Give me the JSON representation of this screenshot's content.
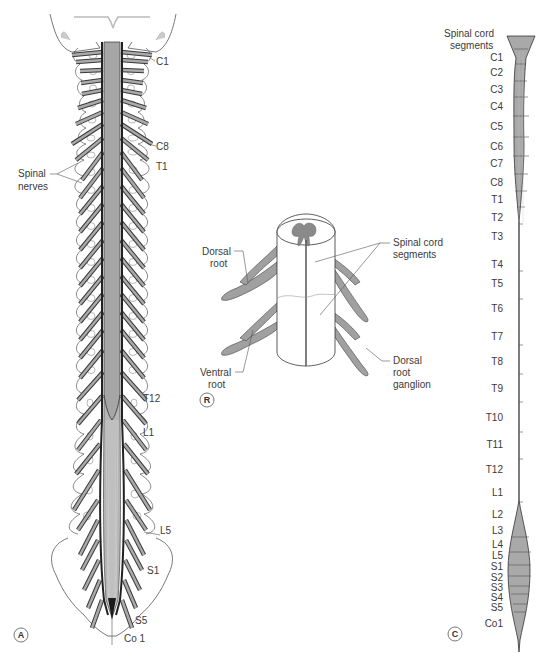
{
  "figure": {
    "panels": [
      {
        "id": "A",
        "description": "Posterior view of vertebral column with spinal cord and spinal nerves",
        "labels": {
          "c1": "C1",
          "c8": "C8",
          "t1": "T1",
          "t12": "T12",
          "l1": "L1",
          "l5": "L5",
          "s1": "S1",
          "s5": "S5",
          "co1": "Co 1",
          "spinal_nerves_line1": "Spinal",
          "spinal_nerves_line2": "nerves"
        }
      },
      {
        "id": "B",
        "letter_shown": "R",
        "description": "Cross-section of spinal cord segments with roots",
        "labels": {
          "dorsal_root_line1": "Dorsal",
          "dorsal_root_line2": "root",
          "ventral_root_line1": "Ventral",
          "ventral_root_line2": "root",
          "spinal_cord_segments_line1": "Spinal cord",
          "spinal_cord_segments_line2": "segments",
          "drg_line1": "Dorsal",
          "drg_line2": "root",
          "drg_line3": "ganglion"
        }
      },
      {
        "id": "C",
        "description": "Spinal cord segments column",
        "title_line1": "Spinal cord",
        "title_line2": "segments",
        "segments": [
          "C1",
          "C2",
          "C3",
          "C4",
          "C5",
          "C6",
          "C7",
          "C8",
          "T1",
          "T2",
          "T3",
          "T4",
          "T5",
          "T6",
          "T7",
          "T8",
          "T9",
          "T10",
          "T11",
          "T12",
          "L1",
          "L2",
          "L3",
          "L4",
          "L5",
          "S1",
          "S2",
          "S3",
          "S4",
          "S5",
          "Co1"
        ]
      }
    ],
    "colors": {
      "cord_fill": "#a8a8a8",
      "nerve_fill": "#9c9c9c",
      "outline": "#3a3a3a",
      "bone_outline": "#555555",
      "background": "#ffffff"
    }
  }
}
